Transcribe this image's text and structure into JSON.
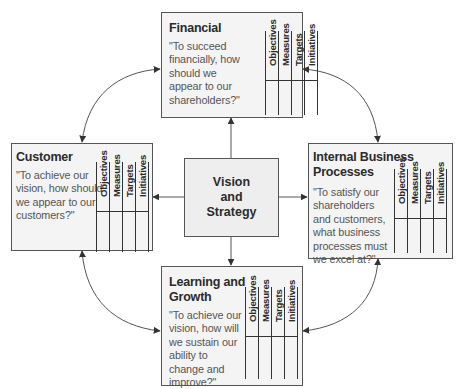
{
  "diagram": {
    "type": "balanced-scorecard",
    "center": {
      "label": "Vision\nand\nStrategy"
    },
    "column_headers": [
      "Objectives",
      "Measures",
      "Targets",
      "Initiatives"
    ],
    "perspectives": [
      {
        "id": "financial",
        "title": "Financial",
        "title_lines": [
          "Financial"
        ],
        "quote_lines": [
          "\"To succeed",
          "financially, how",
          "should we",
          "appear to our",
          "shareholders?\""
        ]
      },
      {
        "id": "customer",
        "title": "Customer",
        "title_lines": [
          "Customer"
        ],
        "quote_lines": [
          "\"To achieve our",
          "vision, how should",
          "we appear to our",
          "customers?\""
        ]
      },
      {
        "id": "internal",
        "title": "Internal Business Processes",
        "title_lines": [
          "Internal Business",
          "Processes"
        ],
        "quote_lines": [
          "\"To satisfy our",
          "shareholders",
          "and customers,",
          "what business",
          "processes must",
          "we excel at?\""
        ]
      },
      {
        "id": "learning",
        "title": "Learning and Growth",
        "title_lines": [
          "Learning and",
          "Growth"
        ],
        "quote_lines": [
          "\"To achieve our",
          "vision, how will",
          "we sustain our",
          "ability to",
          "change and",
          "improve?\""
        ]
      }
    ],
    "connections": [
      {
        "from": "Vision and Strategy",
        "to": "Financial",
        "style": "straight-arrow"
      },
      {
        "from": "Vision and Strategy",
        "to": "Customer",
        "style": "straight-arrow"
      },
      {
        "from": "Vision and Strategy",
        "to": "Internal Business Processes",
        "style": "straight-arrow"
      },
      {
        "from": "Vision and Strategy",
        "to": "Learning and Growth",
        "style": "straight-arrow"
      },
      {
        "from": "Customer",
        "to": "Financial",
        "style": "curved-double-arrow"
      },
      {
        "from": "Financial",
        "to": "Internal Business Processes",
        "style": "curved-double-arrow"
      },
      {
        "from": "Internal Business Processes",
        "to": "Learning and Growth",
        "style": "curved-double-arrow"
      },
      {
        "from": "Learning and Growth",
        "to": "Customer",
        "style": "curved-double-arrow"
      }
    ],
    "colors": {
      "box_fill": "#f4f4f4",
      "vision_fill": "#eeeeee",
      "stroke": "#444444",
      "text": "#2b2b2b",
      "quote_text": "#555555"
    }
  }
}
